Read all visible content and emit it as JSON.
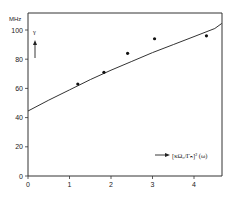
{
  "chart_data": {
    "type": "scatter",
    "title": "",
    "xlabel": "[κ Ω_0 / Γ_n]^2 (ω)",
    "ylabel": "γ",
    "y_unit": "MHz",
    "xlim": [
      0,
      4.7
    ],
    "ylim": [
      0,
      110
    ],
    "x_ticks": [
      0,
      1,
      2,
      3,
      4
    ],
    "y_ticks": [
      0,
      20,
      40,
      60,
      80,
      100
    ],
    "grid": false,
    "legend": null,
    "series": [
      {
        "name": "measured",
        "kind": "points",
        "x": [
          1.2,
          1.83,
          2.4,
          3.05,
          4.3
        ],
        "y": [
          63,
          71,
          84,
          94,
          96
        ]
      },
      {
        "name": "fit",
        "kind": "line",
        "x": [
          0,
          0.5,
          1,
          1.5,
          2,
          2.5,
          3,
          3.5,
          4,
          4.5,
          4.67
        ],
        "y": [
          44.5,
          52,
          59,
          66,
          72.5,
          78.5,
          84.5,
          90,
          95.5,
          101,
          104.5
        ]
      }
    ]
  },
  "labels": {
    "y_unit": "MHz",
    "y_symbol": "γ",
    "x_axis_text": "[κΩ₀/Γₙ]² (ω)",
    "y_ticks": [
      "0",
      "20",
      "40",
      "60",
      "80",
      "100"
    ],
    "x_ticks": [
      "0",
      "1",
      "2",
      "3",
      "4"
    ]
  }
}
